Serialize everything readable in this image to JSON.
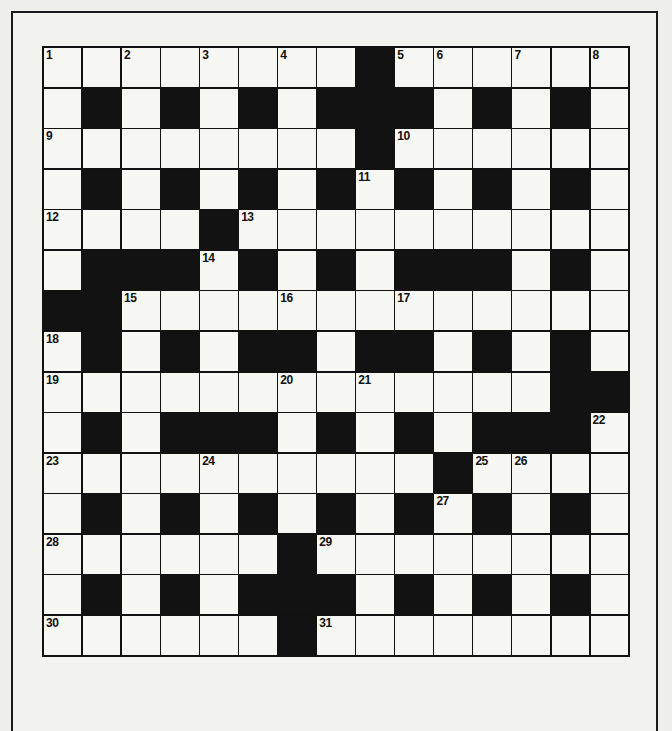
{
  "puzzle": {
    "type": "crossword",
    "rows": 15,
    "cols": 15,
    "grid": [
      "1.2.3.4.#56.7.8",
      ".#.#.#.###.#.#.",
      "9.......#10.....",
      ".#.#.#.#11#.#.#.",
      "12...#13.........",
      ".###14#.#.###.#.",
      "##15...16..17.....",
      "18#.#.##.##.#.#.",
      "19.....20.21....##",
      ".#.###.#.#.###22",
      "23...24.....#2526..",
      ".#.#.#.#.#27#.#.",
      "28.....#29.......",
      ".#.#.###.#.#.#.",
      "30.....#31......."
    ],
    "cells": [
      [
        "1",
        "",
        "2",
        "",
        "3",
        "",
        "4",
        "",
        "#",
        "5",
        "6",
        "",
        "7",
        "",
        "8"
      ],
      [
        "",
        "#",
        "",
        "#",
        "",
        "#",
        "",
        "#",
        "#",
        "#",
        "",
        "#",
        "",
        "#",
        ""
      ],
      [
        "9",
        "",
        "",
        "",
        "",
        "",
        "",
        "",
        "#",
        "10",
        "",
        "",
        "",
        "",
        ""
      ],
      [
        "",
        "#",
        "",
        "#",
        "",
        "#",
        "",
        "#",
        "11",
        "#",
        "",
        "#",
        "",
        "#",
        ""
      ],
      [
        "12",
        "",
        "",
        "",
        "#",
        "13",
        "",
        "",
        "",
        "",
        "",
        "",
        "",
        "",
        ""
      ],
      [
        "",
        "#",
        "#",
        "#",
        "14",
        "#",
        "",
        "#",
        "",
        "#",
        "#",
        "#",
        "",
        "#",
        ""
      ],
      [
        "#",
        "#",
        "15",
        "",
        "",
        "",
        "16",
        "",
        "",
        "17",
        "",
        "",
        "",
        "",
        ""
      ],
      [
        "18",
        "#",
        "",
        "#",
        "",
        "#",
        "#",
        "",
        "#",
        "#",
        "",
        "#",
        "",
        "#",
        ""
      ],
      [
        "19",
        "",
        "",
        "",
        "",
        "",
        "20",
        "",
        "21",
        "",
        "",
        "",
        "",
        "#",
        "#"
      ],
      [
        "",
        "#",
        "",
        "#",
        "#",
        "#",
        "",
        "#",
        "",
        "#",
        "",
        "#",
        "#",
        "#",
        "22"
      ],
      [
        "23",
        "",
        "",
        "",
        "24",
        "",
        "",
        "",
        "",
        "",
        "#",
        "25",
        "26",
        "",
        ""
      ],
      [
        "",
        "#",
        "",
        "#",
        "",
        "#",
        "",
        "#",
        "",
        "#",
        "27",
        "#",
        "",
        "#",
        ""
      ],
      [
        "28",
        "",
        "",
        "",
        "",
        "",
        "#",
        "29",
        "",
        "",
        "",
        "",
        "",
        "",
        ""
      ],
      [
        "",
        "#",
        "",
        "#",
        "",
        "#",
        "#",
        "#",
        "",
        "#",
        "",
        "#",
        "",
        "#",
        ""
      ],
      [
        "30",
        "",
        "",
        "",
        "",
        "",
        "#",
        "31",
        "",
        "",
        "",
        "",
        "",
        "",
        ""
      ]
    ],
    "clue_numbers": [
      1,
      2,
      3,
      4,
      5,
      6,
      7,
      8,
      9,
      10,
      11,
      12,
      13,
      14,
      15,
      16,
      17,
      18,
      19,
      20,
      21,
      22,
      23,
      24,
      25,
      26,
      27,
      28,
      29,
      30,
      31
    ],
    "colors": {
      "black_square": "#121212",
      "white_square": "#f7f7f4",
      "paper": "#eeeeea",
      "line": "#111111"
    }
  }
}
